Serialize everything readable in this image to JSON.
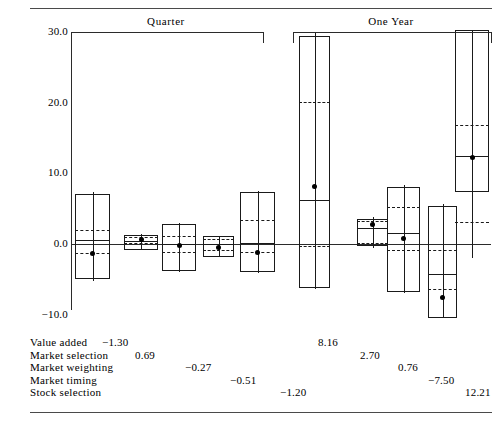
{
  "chart_data": {
    "type": "boxplot",
    "title": "",
    "xlabel": "",
    "ylabel": "",
    "ylim": [
      -10.0,
      30.0
    ],
    "grid": false,
    "legend_position": "none",
    "y_ticks": [
      "30.0",
      "20.0",
      "10.0",
      "0.0",
      "−10.0"
    ],
    "y_tick_values": [
      30.0,
      20.0,
      10.0,
      0.0,
      -10.0
    ],
    "panels": [
      {
        "label": "Quarter",
        "categories": [
          "Value added",
          "Market selection",
          "Market weighting",
          "Market timing",
          "Stock selection"
        ],
        "values": [
          -1.3,
          0.69,
          -0.27,
          -0.51,
          -1.2
        ],
        "boxes": [
          {
            "name": "Value added",
            "whisker_low": -5.2,
            "q1": -4.9,
            "median": 0.5,
            "q3": 7.1,
            "whisker_high": 7.4,
            "dashed_upper": 2.0,
            "dashed_lower": -1.3,
            "point": -1.3
          },
          {
            "name": "Market selection",
            "whisker_low": -0.9,
            "q1": -0.8,
            "median": 0.45,
            "q3": 1.3,
            "whisker_high": 1.4,
            "dashed_upper": 1.0,
            "dashed_lower": 0.2,
            "point": 0.69
          },
          {
            "name": "Market weighting",
            "whisker_low": -4.0,
            "q1": -3.8,
            "median": 0.0,
            "q3": 2.9,
            "whisker_high": 3.0,
            "dashed_upper": 1.1,
            "dashed_lower": -1.2,
            "point": -0.27
          },
          {
            "name": "Market timing",
            "whisker_low": -1.9,
            "q1": -1.8,
            "median": 0.05,
            "q3": 1.1,
            "whisker_high": 1.2,
            "dashed_upper": 0.7,
            "dashed_lower": -0.8,
            "point": -0.51
          },
          {
            "name": "Stock selection",
            "whisker_low": -4.1,
            "q1": -4.0,
            "median": 0.2,
            "q3": 7.3,
            "whisker_high": 7.5,
            "dashed_upper": 3.4,
            "dashed_lower": -1.1,
            "point": -1.2
          }
        ]
      },
      {
        "label": "One Year",
        "categories": [
          "Value added",
          "Market selection",
          "Market weighting",
          "Market timing",
          "Stock selection"
        ],
        "values": [
          8.16,
          2.7,
          0.76,
          -7.5,
          12.21
        ],
        "boxes": [
          {
            "name": "Value added",
            "whisker_low": -6.4,
            "q1": -6.2,
            "median": 6.2,
            "q3": 29.5,
            "whisker_high": 29.8,
            "dashed_upper": 20.1,
            "dashed_lower": -0.3,
            "point": 8.16
          },
          {
            "name": "Market selection",
            "whisker_low": -0.5,
            "q1": -0.3,
            "median": 2.3,
            "q3": 3.6,
            "whisker_high": 3.8,
            "dashed_upper": 3.3,
            "dashed_lower": 0.1,
            "point": 2.7
          },
          {
            "name": "Market weighting",
            "whisker_low": -7.0,
            "q1": -6.8,
            "median": 1.5,
            "q3": 8.1,
            "whisker_high": 8.3,
            "dashed_upper": 5.3,
            "dashed_lower": -0.9,
            "point": 0.76
          },
          {
            "name": "Market timing",
            "whisker_low": -12.2,
            "q1": -11.9,
            "median": -4.2,
            "q3": 5.4,
            "whisker_high": 5.6,
            "dashed_upper": -0.9,
            "dashed_lower": -6.3,
            "point": -7.5
          },
          {
            "name": "Stock selection",
            "whisker_low": -2.0,
            "q1": 7.4,
            "median": 12.4,
            "q3": 30.5,
            "whisker_high": 31.5,
            "dashed_upper": 16.8,
            "dashed_lower": 3.1,
            "point": 12.21
          }
        ]
      }
    ],
    "value_table": {
      "rows": [
        {
          "name": "Value added",
          "quarter": "−1.30",
          "one_year": "8.16"
        },
        {
          "name": "Market selection",
          "quarter": "0.69",
          "one_year": "2.70"
        },
        {
          "name": "Market weighting",
          "quarter": "−0.27",
          "one_year": "0.76"
        },
        {
          "name": "Market timing",
          "quarter": "−0.51",
          "one_year": "−7.50"
        },
        {
          "name": "Stock selection",
          "quarter": "−1.20",
          "one_year": "12.21"
        }
      ]
    },
    "colors": {
      "ink": "#1a1a1a",
      "rule": "#4a4a4a",
      "marker": "#000000"
    }
  },
  "axis": {
    "tick_30": "30.0",
    "tick_20": "20.0",
    "tick_10": "10.0",
    "tick_0": "0.0",
    "tick_neg10": "−10.0"
  },
  "panels": {
    "quarter_label": "Quarter",
    "one_year_label": "One Year"
  },
  "table": {
    "row0_name": "Value added",
    "row1_name": "Market selection",
    "row2_name": "Market weighting",
    "row3_name": "Market timing",
    "row4_name": "Stock selection",
    "q0": "−1.30",
    "q1": "0.69",
    "q2": "−0.27",
    "q3": "−0.51",
    "q4": "−1.20",
    "y0": "8.16",
    "y1": "2.70",
    "y2": "0.76",
    "y3": "−7.50",
    "y4": "12.21"
  }
}
